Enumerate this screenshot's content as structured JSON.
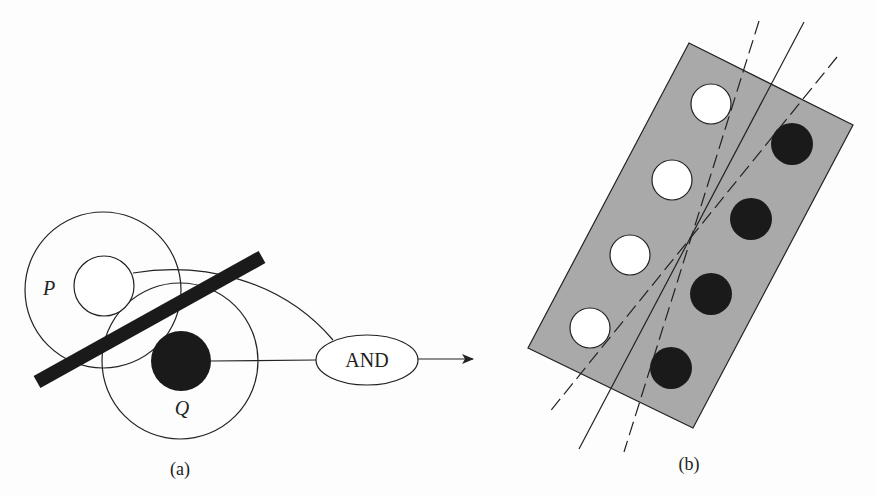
{
  "panel_a": {
    "caption": "(a)",
    "receptive_field_p_label": "P",
    "receptive_field_q_label": "Q",
    "gate_label": "AND"
  },
  "panel_b": {
    "caption": "(b)",
    "white_dot_count": 4,
    "black_dot_count": 4
  },
  "colors": {
    "background": "#fdfdfd",
    "stroke": "#222222",
    "fill_dark": "#1a1a1a",
    "rect_fill": "#a9a9a9"
  }
}
